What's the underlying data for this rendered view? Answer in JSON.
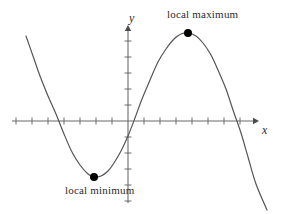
{
  "figure": {
    "background_color": "#ffffff",
    "curve_color": "#555555",
    "axis_color": "#6b6b6b",
    "point_color": "#000000",
    "text_color": "#2b2b2b"
  },
  "annotations": {
    "local_maximum_label": "local maximum",
    "local_minimum_label": "local minimum"
  },
  "axes": {
    "x_label": "x",
    "y_label": "y"
  },
  "chart_data": {
    "type": "line",
    "title": "",
    "subtitle": "",
    "xlabel": "x",
    "ylabel": "y",
    "grid": false,
    "legend": "none",
    "axis_style": {
      "x_axis_pixel_y": 121,
      "y_axis_pixel_x": 128,
      "x_axis_from_pixel_x": 12,
      "x_axis_to_pixel_x": 257,
      "y_axis_from_pixel_y": 27,
      "y_axis_to_pixel_y": 203,
      "arrowheads": [
        "x-positive",
        "y-positive"
      ],
      "x_tick_spacing_px": 16,
      "y_tick_spacing_px": 16,
      "tick_length_px": 7,
      "tick_labels": []
    },
    "series": [
      {
        "name": "curve",
        "points_pixel": [
          [
            26,
            36
          ],
          [
            33,
            56
          ],
          [
            40,
            76
          ],
          [
            48,
            96
          ],
          [
            56,
            114
          ],
          [
            64,
            134
          ],
          [
            72,
            152
          ],
          [
            80,
            165
          ],
          [
            88,
            174
          ],
          [
            94,
            177
          ],
          [
            101,
            176
          ],
          [
            108,
            171
          ],
          [
            114,
            163
          ],
          [
            121,
            151
          ],
          [
            128,
            136
          ],
          [
            135,
            118
          ],
          [
            142,
            99
          ],
          [
            150,
            80
          ],
          [
            158,
            62
          ],
          [
            166,
            49
          ],
          [
            174,
            39
          ],
          [
            181,
            34
          ],
          [
            188,
            33
          ],
          [
            196,
            36
          ],
          [
            203,
            43
          ],
          [
            211,
            55
          ],
          [
            218,
            70
          ],
          [
            226,
            89
          ],
          [
            233,
            110
          ],
          [
            241,
            133
          ],
          [
            248,
            157
          ],
          [
            256,
            184
          ],
          [
            267,
            210
          ]
        ]
      }
    ],
    "markers": [
      {
        "name": "local-maximum",
        "label": "local maximum",
        "pixel_x": 188,
        "pixel_y": 33,
        "radius_px": 4,
        "filled": true
      },
      {
        "name": "local-minimum",
        "label": "local minimum",
        "pixel_x": 94,
        "pixel_y": 177,
        "radius_px": 4,
        "filled": true
      }
    ]
  }
}
